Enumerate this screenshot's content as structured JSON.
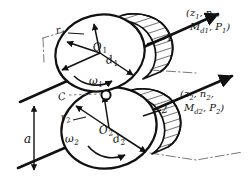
{
  "figure": {
    "background_color": "#ffffff",
    "line_color": "#111111"
  },
  "labels": {
    "radius_1": "r",
    "radius_1_sub": "1",
    "center_1": "O",
    "center_1_sub": "1",
    "diameter_1": "d",
    "diameter_1_sub": "1",
    "omega_1": "ω",
    "omega_1_sub": "1",
    "contact_point": "C",
    "radius_2": "r",
    "radius_2_sub": "2",
    "center_2": "O",
    "center_2_sub": "2",
    "diameter_2": "d",
    "diameter_2_sub": "2",
    "omega_2": "ω",
    "omega_2_sub": "2",
    "center_distance": "a",
    "part_number_1": "1",
    "part_number_2": "2"
  },
  "callout_top": {
    "line1_prefix": "(z",
    "line1_sub1": "1",
    "line1_mid": ", n",
    "line1_sub2": "1",
    "line1_suffix": ",",
    "line2_prefix": "M",
    "line2_sub1": "d1",
    "line2_mid": ", P",
    "line2_sub2": "1",
    "line2_suffix": ")",
    "full_text": "(z1, n1, Md1, P1)"
  },
  "callout_bottom": {
    "line1_prefix": "(z",
    "line1_sub1": "2",
    "line1_mid": ", n",
    "line1_sub2": "2",
    "line1_suffix": ",",
    "line2_prefix": "M",
    "line2_sub1": "d2",
    "line2_mid": ", P",
    "line2_sub2": "2",
    "line2_suffix": ")",
    "full_text": "(z2, n2, Md2, P2)"
  }
}
